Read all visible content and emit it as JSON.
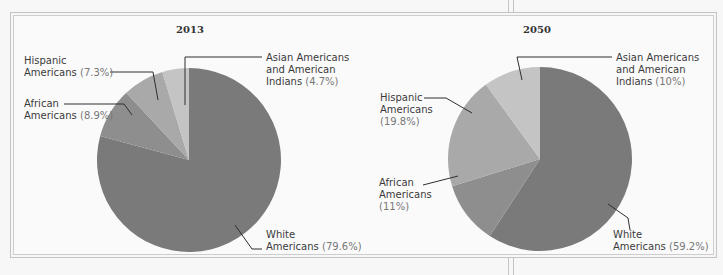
{
  "chart_data": [
    {
      "type": "pie",
      "title": "2013",
      "categories": [
        "White Americans",
        "African Americans",
        "Hispanic Americans",
        "Asian Americans and American Indians"
      ],
      "values": [
        79.6,
        8.9,
        7.3,
        4.7
      ],
      "labels": [
        "White Americans (79.6%)",
        "African Americans (8.9%)",
        "Hispanic Americans (7.3%)",
        "Asian Americans and American Indians (4.7%)"
      ],
      "colors": [
        "#7a7a7a",
        "#8e8e8e",
        "#a9a9a9",
        "#c4c4c4"
      ],
      "legend_position": "callout leader lines"
    },
    {
      "type": "pie",
      "title": "2050",
      "categories": [
        "White Americans",
        "African Americans",
        "Hispanic Americans",
        "Asian Americans and American Indians"
      ],
      "values": [
        59.2,
        11,
        19.8,
        10
      ],
      "labels": [
        "White Americans (59.2%)",
        "African Americans (11%)",
        "Hispanic Americans (19.8%)",
        "Asian Americans and American Indians (10%)"
      ],
      "colors": [
        "#7a7a7a",
        "#8e8e8e",
        "#a9a9a9",
        "#c4c4c4"
      ],
      "legend_position": "callout leader lines"
    }
  ],
  "charts": {
    "left": {
      "title": "2013",
      "white": {
        "l1": "White",
        "l2": "Americans",
        "pct": "(79.6%)"
      },
      "african": {
        "l1": "African",
        "l2": "Americans",
        "pct": "(8.9%)"
      },
      "hispanic": {
        "l1": "Hispanic",
        "l2": "Americans",
        "pct": "(7.3%)"
      },
      "asian": {
        "l1": "Asian Americans",
        "l2": "and American",
        "l3": "Indians",
        "pct": "(4.7%)"
      }
    },
    "right": {
      "title": "2050",
      "white": {
        "l1": "White",
        "l2": "Americans",
        "pct": "(59.2%)"
      },
      "african": {
        "l1": "African",
        "l2": "Americans",
        "pct": "(11%)"
      },
      "hispanic": {
        "l1": "Hispanic",
        "l2": "Americans",
        "pct": "(19.8%)"
      },
      "asian": {
        "l1": "Asian Americans",
        "l2": "and American",
        "l3": "Indians",
        "pct": "(10%)"
      }
    }
  }
}
